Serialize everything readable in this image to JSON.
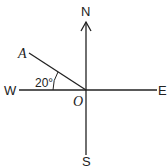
{
  "diagram": {
    "type": "compass-bearing",
    "labels": {
      "north": "N",
      "south": "S",
      "east": "E",
      "west": "W",
      "origin": "O",
      "point": "A",
      "angle": "20°"
    },
    "angle_degrees": 20,
    "angle_between": [
      "OW",
      "OA"
    ],
    "colors": {
      "stroke": "#222222",
      "background": "#ffffff"
    }
  }
}
